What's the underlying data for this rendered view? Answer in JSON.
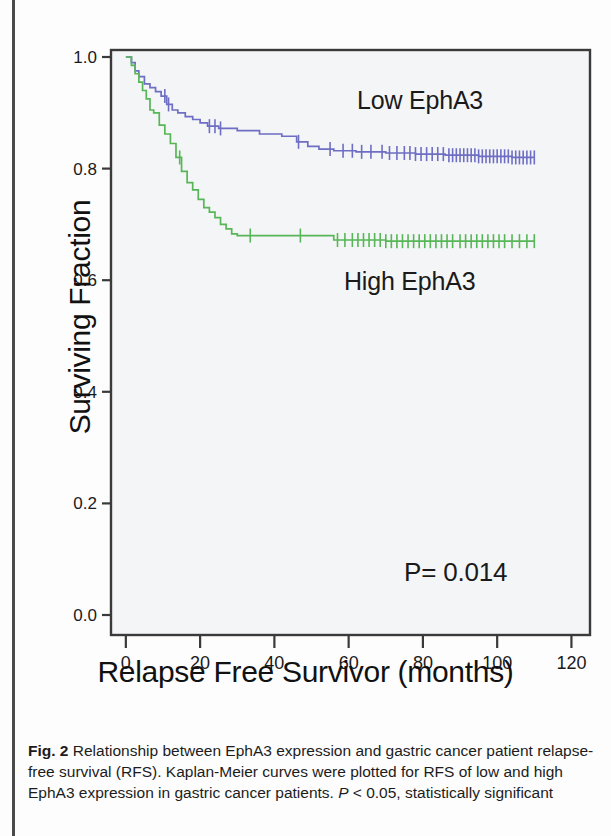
{
  "figure": {
    "caption_label": "Fig. 2",
    "caption_text": " Relationship between EphA3 expression and gastric cancer patient relapse-free survival (RFS). Kaplan-Meier curves were plotted for RFS of low and high EphA3 expression in gastric cancer patients. ",
    "caption_stat_italic": "P",
    "caption_stat_rest": " < 0.05, statistically significant"
  },
  "chart_data": {
    "type": "line",
    "subtype": "kaplan-meier",
    "title": "",
    "xlabel": "Relapse Free Survivor (months)",
    "ylabel": "Surviving Fraction",
    "xlim": [
      -4,
      125
    ],
    "ylim": [
      0.0,
      1.05
    ],
    "xticks": [
      0,
      20,
      40,
      60,
      80,
      100,
      120
    ],
    "xticklabels": [
      "0",
      "20",
      "40",
      "60",
      "80",
      "100",
      "120"
    ],
    "yticks": [
      0.0,
      0.2,
      0.4,
      0.6,
      0.8,
      1.0
    ],
    "yticklabels": [
      "0.0",
      "0.2",
      "0.4",
      "0.6",
      "0.8",
      "1.0"
    ],
    "grid": false,
    "legend_position": "in-plot-annotations",
    "annotations": [
      {
        "name": "low-epha3",
        "text": "Low EphA3",
        "x": 62,
        "y": 0.895
      },
      {
        "name": "high-epha3",
        "text": "High EphA3",
        "x": 58,
        "y": 0.575
      },
      {
        "name": "p-value",
        "text": "P= 0.014",
        "x": 96,
        "y": 0.08
      }
    ],
    "colors": {
      "low_expression": "#6E6EC4",
      "high_expression": "#57B657",
      "axis": "#3a3a3a",
      "plot_background": "#f4f5f7"
    },
    "series": [
      {
        "name": "Low EphA3",
        "color": "#6E6EC4",
        "plateau_value": 0.82,
        "max_followup": 110,
        "steps": [
          [
            0,
            1.0
          ],
          [
            1.5,
            0.99
          ],
          [
            2.5,
            0.975
          ],
          [
            3.5,
            0.965
          ],
          [
            5,
            0.952
          ],
          [
            6.5,
            0.945
          ],
          [
            8,
            0.938
          ],
          [
            9.5,
            0.93
          ],
          [
            11,
            0.915
          ],
          [
            12.5,
            0.905
          ],
          [
            14,
            0.9
          ],
          [
            16,
            0.893
          ],
          [
            18,
            0.888
          ],
          [
            20,
            0.882
          ],
          [
            22,
            0.876
          ],
          [
            25,
            0.872
          ],
          [
            30,
            0.868
          ],
          [
            36,
            0.862
          ],
          [
            42,
            0.858
          ],
          [
            46,
            0.848
          ],
          [
            49,
            0.84
          ],
          [
            52,
            0.835
          ],
          [
            56,
            0.832
          ],
          [
            62,
            0.83
          ],
          [
            70,
            0.828
          ],
          [
            78,
            0.826
          ],
          [
            86,
            0.824
          ],
          [
            95,
            0.822
          ],
          [
            104,
            0.82
          ],
          [
            110,
            0.82
          ]
        ],
        "censor_marks": [
          10.5,
          11.5,
          22.5,
          24,
          25.5,
          46.5,
          55,
          58.5,
          61,
          63.5,
          66,
          69,
          71,
          73,
          75,
          76.5,
          78,
          79.5,
          81,
          82.5,
          84,
          85.5,
          87,
          88,
          89,
          90,
          91,
          92,
          93,
          94,
          95,
          96,
          97,
          98,
          99,
          100,
          101,
          102,
          103,
          104,
          105,
          106,
          107,
          108,
          109,
          110
        ]
      },
      {
        "name": "High EphA3",
        "color": "#57B657",
        "plateau_value": 0.67,
        "max_followup": 110,
        "steps": [
          [
            0,
            1.0
          ],
          [
            1.5,
            0.985
          ],
          [
            2.5,
            0.97
          ],
          [
            3.5,
            0.955
          ],
          [
            4.5,
            0.94
          ],
          [
            5.5,
            0.925
          ],
          [
            6.5,
            0.905
          ],
          [
            7.5,
            0.9
          ],
          [
            9,
            0.878
          ],
          [
            10.5,
            0.862
          ],
          [
            12,
            0.845
          ],
          [
            13.5,
            0.82
          ],
          [
            15,
            0.795
          ],
          [
            16.5,
            0.775
          ],
          [
            18,
            0.762
          ],
          [
            19.5,
            0.745
          ],
          [
            21,
            0.73
          ],
          [
            22.5,
            0.722
          ],
          [
            24,
            0.712
          ],
          [
            25.5,
            0.7
          ],
          [
            27,
            0.692
          ],
          [
            28.5,
            0.683
          ],
          [
            30,
            0.68
          ],
          [
            40,
            0.68
          ],
          [
            52,
            0.68
          ],
          [
            56,
            0.672
          ],
          [
            70,
            0.67
          ],
          [
            90,
            0.67
          ],
          [
            110,
            0.67
          ]
        ],
        "censor_marks": [
          14.5,
          33.5,
          47,
          57,
          59,
          61,
          62.5,
          64,
          65.5,
          67,
          68.5,
          70,
          71.5,
          73,
          74.5,
          76,
          77.5,
          79,
          80.5,
          82,
          83.5,
          85,
          86.5,
          88,
          90,
          91.5,
          93,
          94.5,
          96,
          97.5,
          99,
          100.5,
          102,
          104,
          106,
          108,
          110
        ]
      }
    ]
  }
}
